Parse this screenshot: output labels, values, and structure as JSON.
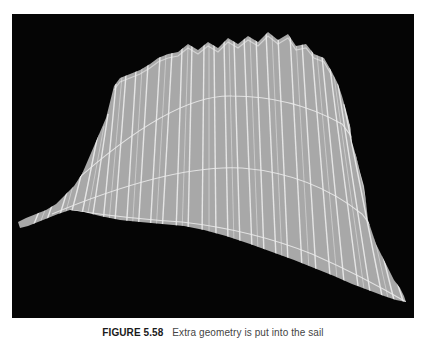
{
  "figure": {
    "label": "FIGURE 5.58",
    "caption": "Extra geometry is put into the sail",
    "background_color": "#050505",
    "mesh_fill_color": "#a8a8a8",
    "mesh_line_color": "#ececec"
  }
}
